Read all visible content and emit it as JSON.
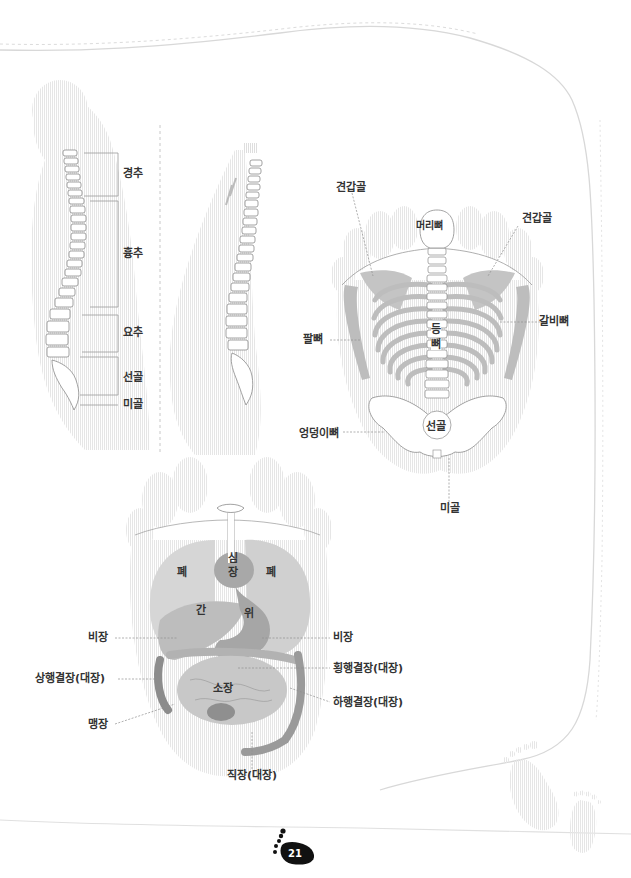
{
  "page": {
    "number": "21",
    "colors": {
      "bone_fill": "#ffffff",
      "bone_outline": "#8a8a8a",
      "shade_bone": "#bdbdbd",
      "organ_light": "#d6d6d6",
      "organ_mid": "#b8b8b8",
      "organ_dark": "#9a9a9a",
      "foot_hatch": "#eeeeee",
      "leader_line": "#9a9a9a",
      "page_icon": "#111111"
    }
  },
  "spine_side": {
    "labels": {
      "cervical": "경추",
      "thoracic": "흉추",
      "lumbar": "요추",
      "sacrum": "선골",
      "coccyx": "미골"
    }
  },
  "skeleton_back": {
    "labels": {
      "scapula_left": "견갑골",
      "scapula_right": "견갑골",
      "skull": "머리뼈",
      "ribs": "갈비뼈",
      "arm_bone": "팔뼈",
      "spine_1": "등",
      "spine_2": "뼈",
      "pelvis": "엉덩이뼈",
      "sacrum": "선골",
      "coccyx": "미골"
    }
  },
  "organs": {
    "labels": {
      "lung_left": "폐",
      "lung_right": "폐",
      "heart_1": "심",
      "heart_2": "장",
      "liver": "간",
      "stomach": "위",
      "spleen_left": "비장",
      "spleen_right": "비장",
      "ascending_colon": "상행결장(대장)",
      "transverse_colon": "횡행결장(대장)",
      "small_intestine": "소장",
      "descending_colon": "하행결장(대장)",
      "cecum": "맹장",
      "rectum": "직장(대장)"
    }
  }
}
